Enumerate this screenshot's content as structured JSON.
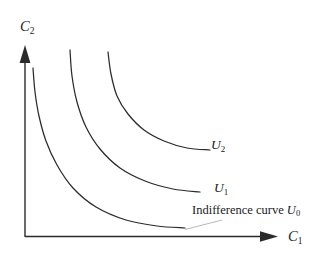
{
  "figure": {
    "background_color": "#ffffff",
    "ink_color": "#2b2b2b",
    "leader_color": "#b9b9b9",
    "axes": {
      "y_axis": {
        "name": "C2",
        "label_main": "C",
        "label_sub": "2",
        "origin": [
          25,
          237
        ],
        "tip": [
          25,
          45
        ]
      },
      "x_axis": {
        "name": "C1",
        "label_main": "C",
        "label_sub": "1",
        "origin": [
          25,
          237
        ],
        "tip": [
          278,
          236
        ]
      }
    },
    "curve_labels": [
      {
        "id": "U2",
        "main": "U",
        "sub": "2"
      },
      {
        "id": "U1",
        "main": "U",
        "sub": "1"
      }
    ],
    "annotation": {
      "prefix": "Indifference curve ",
      "main": "U",
      "sub": "0"
    }
  },
  "chart_data": {
    "type": "line",
    "title": "",
    "xlabel": "C1",
    "ylabel": "C2",
    "grid": false,
    "legend": "inline-labels",
    "axis_ranges": {
      "x": [
        0,
        1
      ],
      "y": [
        0,
        1
      ]
    },
    "series": [
      {
        "name": "U0",
        "label": "Indifference curve U0",
        "label_position": [
          192,
          204
        ],
        "points": [
          [
            33,
            68
          ],
          [
            35,
            92
          ],
          [
            39,
            116
          ],
          [
            46,
            141
          ],
          [
            57,
            165
          ],
          [
            73,
            188
          ],
          [
            96,
            207
          ],
          [
            126,
            220
          ],
          [
            157,
            226
          ],
          [
            185,
            228
          ]
        ]
      },
      {
        "name": "U1",
        "label": "U1",
        "label_position": [
          214,
          181
        ],
        "points": [
          [
            70,
            50
          ],
          [
            72,
            76
          ],
          [
            77,
            102
          ],
          [
            86,
            127
          ],
          [
            100,
            149
          ],
          [
            120,
            168
          ],
          [
            145,
            181
          ],
          [
            173,
            189
          ],
          [
            200,
            192
          ]
        ]
      },
      {
        "name": "U2",
        "label": "U2",
        "label_position": [
          211,
          138
        ],
        "points": [
          [
            108,
            52
          ],
          [
            111,
            74
          ],
          [
            117,
            96
          ],
          [
            128,
            114
          ],
          [
            144,
            130
          ],
          [
            164,
            141
          ],
          [
            187,
            148
          ],
          [
            210,
            150
          ]
        ]
      }
    ]
  }
}
